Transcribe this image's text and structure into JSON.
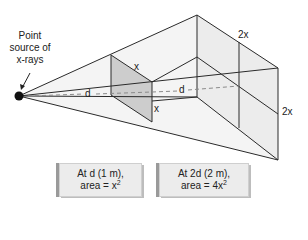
{
  "diagram": {
    "source_label_lines": [
      "Point",
      "source of",
      "x-rays"
    ],
    "near_square": {
      "distance_label": "d",
      "side_top_label": "x",
      "side_right_label": "x"
    },
    "far_square": {
      "distance_label": "d",
      "side_top_label": "2x",
      "side_right_label": "2x"
    },
    "boxes": [
      {
        "line1": "At d (1 m),",
        "line2_prefix": "area = x",
        "line2_exp": "2"
      },
      {
        "line1": "At 2d (2 m),",
        "line2_prefix": "area = 4x",
        "line2_exp": "2"
      }
    ],
    "colors": {
      "line": "#2a2a2a",
      "near_fill": "#cfcfcf",
      "far_fill": "#ececec",
      "pyramid_fill": "#f3f3f3",
      "dash": "#8a8a8a"
    }
  }
}
